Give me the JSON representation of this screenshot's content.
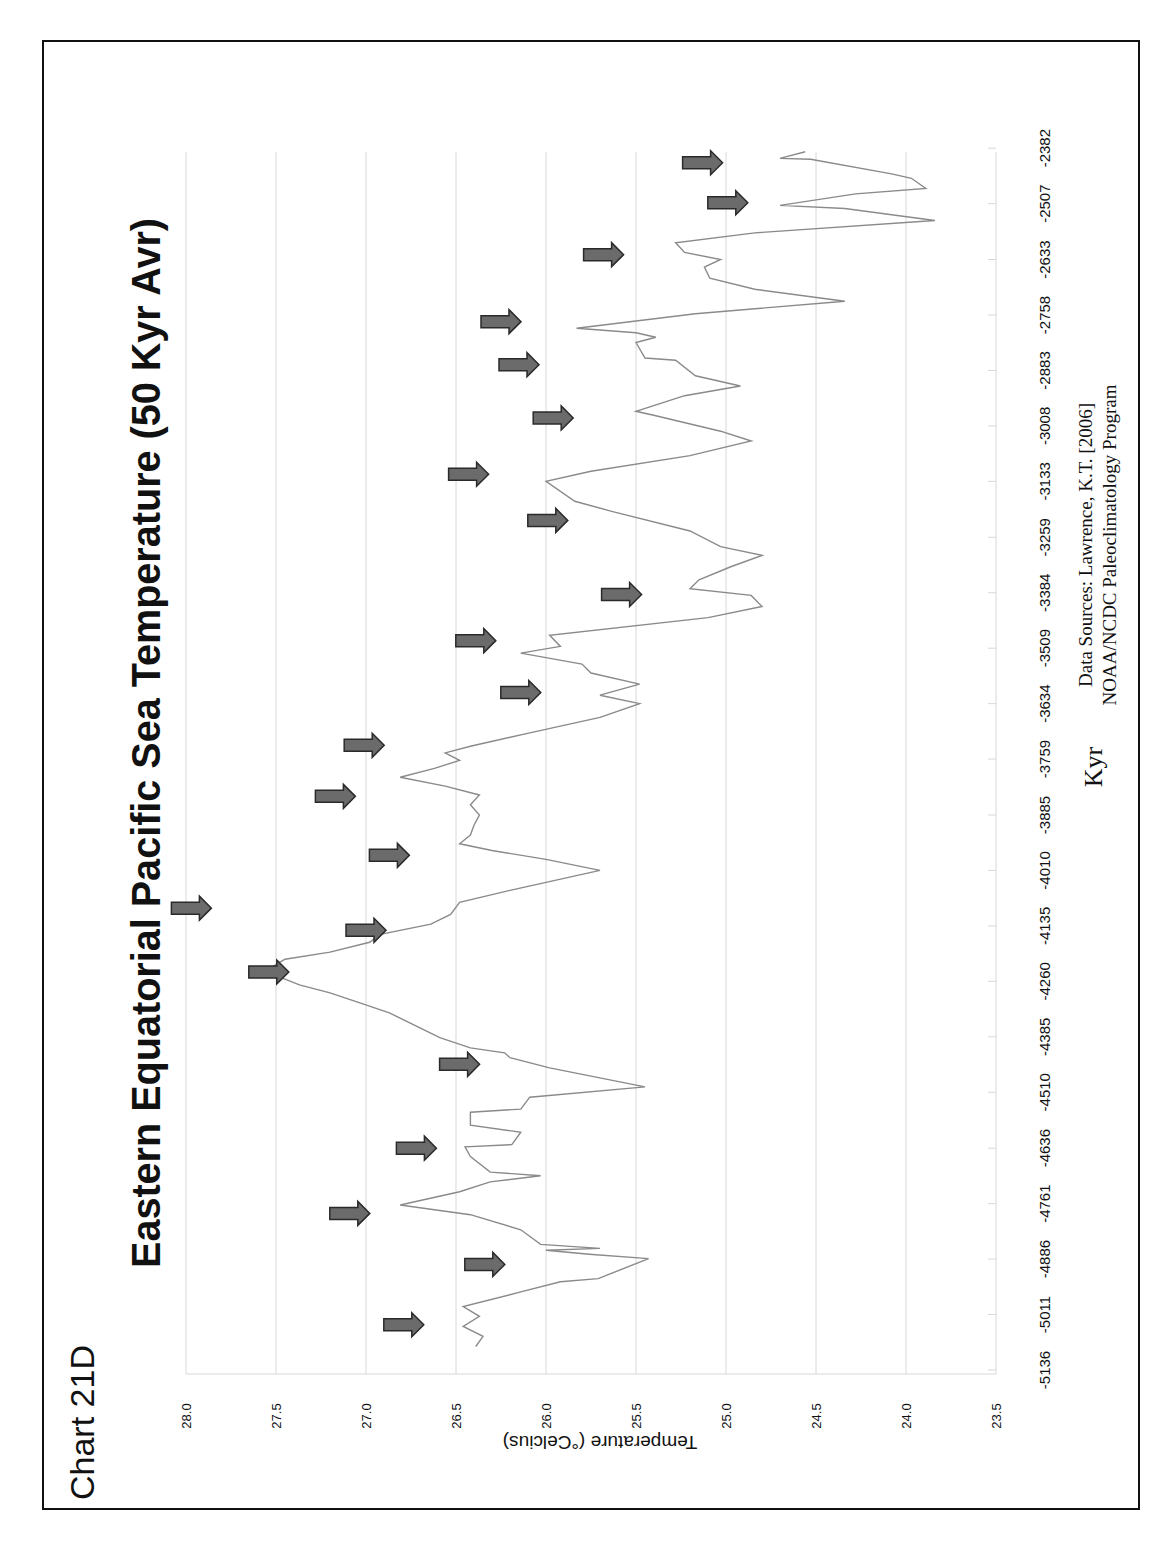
{
  "chart_label": "Chart 21D",
  "colors": {
    "line": "#8a8a8a",
    "grid": "#d8d8d8",
    "arrow_fill": "#6b6b6b",
    "arrow_stroke": "#2a2a2a",
    "frame": "#111111",
    "text": "#111111"
  },
  "chart_data": {
    "type": "line",
    "title": "Eastern Equatorial Pacific Sea Temperature (50 Kyr Avr)",
    "xlabel": "Kyr",
    "ylabel": "Temperature (°Celcius)",
    "orientation": "rotated-90-ccw",
    "xlim": [
      -5136,
      -2382
    ],
    "ylim": [
      23.5,
      28.0
    ],
    "grid": true,
    "x_ticks": [
      "-5136",
      "-5011",
      "-4886",
      "-4761",
      "-4636",
      "-4510",
      "-4385",
      "-4260",
      "-4135",
      "-4010",
      "-3885",
      "-3759",
      "-3634",
      "-3509",
      "-3384",
      "-3259",
      "-3133",
      "-3008",
      "-2883",
      "-2758",
      "-2633",
      "-2507",
      "-2382"
    ],
    "y_ticks": [
      "28.0",
      "27.5",
      "27.0",
      "26.5",
      "26.0",
      "25.5",
      "25.0",
      "24.5",
      "24.0",
      "23.5"
    ],
    "source_lines": [
      "Data Sources:  Lawrence, K.T. [2006]",
      "NOAA/NCDC Paleoclimatology Program"
    ],
    "series": [
      {
        "name": "Sea Temperature",
        "points": [
          [
            -5083,
            26.39
          ],
          [
            -5060,
            26.35
          ],
          [
            -5038,
            26.46
          ],
          [
            -5015,
            26.37
          ],
          [
            -4993,
            26.46
          ],
          [
            -4960,
            26.14
          ],
          [
            -4937,
            25.92
          ],
          [
            -4930,
            25.71
          ],
          [
            -4885,
            25.43
          ],
          [
            -4875,
            25.76
          ],
          [
            -4866,
            26.0
          ],
          [
            -4862,
            25.7
          ],
          [
            -4853,
            26.03
          ],
          [
            -4820,
            26.14
          ],
          [
            -4786,
            26.42
          ],
          [
            -4764,
            26.81
          ],
          [
            -4734,
            26.48
          ],
          [
            -4712,
            26.31
          ],
          [
            -4698,
            26.03
          ],
          [
            -4690,
            26.31
          ],
          [
            -4655,
            26.42
          ],
          [
            -4633,
            26.45
          ],
          [
            -4628,
            26.19
          ],
          [
            -4600,
            26.14
          ],
          [
            -4584,
            26.42
          ],
          [
            -4555,
            26.42
          ],
          [
            -4548,
            26.14
          ],
          [
            -4521,
            26.09
          ],
          [
            -4498,
            25.45
          ],
          [
            -4455,
            25.98
          ],
          [
            -4432,
            26.2
          ],
          [
            -4421,
            26.23
          ],
          [
            -4410,
            26.42
          ],
          [
            -4387,
            26.59
          ],
          [
            -4365,
            26.7
          ],
          [
            -4331,
            26.87
          ],
          [
            -4309,
            27.03
          ],
          [
            -4286,
            27.2
          ],
          [
            -4268,
            27.37
          ],
          [
            -4255,
            27.45
          ],
          [
            -4245,
            27.53
          ],
          [
            -4232,
            27.54
          ],
          [
            -4210,
            27.45
          ],
          [
            -4194,
            27.2
          ],
          [
            -4172,
            26.98
          ],
          [
            -4154,
            26.92
          ],
          [
            -4131,
            26.64
          ],
          [
            -4109,
            26.53
          ],
          [
            -4082,
            26.48
          ],
          [
            -4055,
            26.2
          ],
          [
            -4010,
            25.7
          ],
          [
            -3985,
            26.0
          ],
          [
            -3965,
            26.3
          ],
          [
            -3950,
            26.48
          ],
          [
            -3930,
            26.42
          ],
          [
            -3908,
            26.4
          ],
          [
            -3885,
            26.37
          ],
          [
            -3862,
            26.42
          ],
          [
            -3840,
            26.37
          ],
          [
            -3820,
            26.56
          ],
          [
            -3800,
            26.81
          ],
          [
            -3780,
            26.62
          ],
          [
            -3762,
            26.48
          ],
          [
            -3745,
            26.56
          ],
          [
            -3730,
            26.42
          ],
          [
            -3700,
            26.09
          ],
          [
            -3665,
            25.7
          ],
          [
            -3634,
            25.48
          ],
          [
            -3615,
            25.7
          ],
          [
            -3590,
            25.48
          ],
          [
            -3565,
            25.75
          ],
          [
            -3545,
            25.8
          ],
          [
            -3520,
            26.14
          ],
          [
            -3505,
            25.92
          ],
          [
            -3480,
            25.98
          ],
          [
            -3440,
            25.1
          ],
          [
            -3415,
            24.8
          ],
          [
            -3390,
            24.86
          ],
          [
            -3375,
            25.2
          ],
          [
            -3355,
            25.15
          ],
          [
            -3325,
            24.97
          ],
          [
            -3300,
            24.8
          ],
          [
            -3280,
            25.03
          ],
          [
            -3245,
            25.2
          ],
          [
            -3200,
            25.64
          ],
          [
            -3178,
            25.84
          ],
          [
            -3133,
            26.0
          ],
          [
            -3110,
            25.75
          ],
          [
            -3075,
            25.2
          ],
          [
            -3042,
            24.86
          ],
          [
            -3020,
            25.03
          ],
          [
            -2985,
            25.39
          ],
          [
            -2975,
            25.5
          ],
          [
            -2940,
            25.23
          ],
          [
            -2918,
            24.92
          ],
          [
            -2895,
            25.17
          ],
          [
            -2860,
            25.28
          ],
          [
            -2855,
            25.45
          ],
          [
            -2820,
            25.5
          ],
          [
            -2808,
            25.39
          ],
          [
            -2798,
            25.5
          ],
          [
            -2788,
            25.83
          ],
          [
            -2755,
            25.17
          ],
          [
            -2727,
            24.34
          ],
          [
            -2700,
            24.84
          ],
          [
            -2675,
            25.09
          ],
          [
            -2650,
            25.12
          ],
          [
            -2633,
            25.03
          ],
          [
            -2617,
            25.23
          ],
          [
            -2595,
            25.28
          ],
          [
            -2573,
            24.84
          ],
          [
            -2545,
            23.84
          ],
          [
            -2518,
            24.34
          ],
          [
            -2511,
            24.7
          ],
          [
            -2485,
            24.28
          ],
          [
            -2473,
            23.89
          ],
          [
            -2450,
            23.97
          ],
          [
            -2440,
            24.08
          ],
          [
            -2407,
            24.53
          ],
          [
            -2405,
            24.7
          ],
          [
            -2390,
            24.56
          ]
        ]
      }
    ],
    "annotations": {
      "type": "arrows",
      "description": "right-pointing arrows marking temperature peaks",
      "points": [
        [
          -5034,
          26.79
        ],
        [
          -4898,
          26.34
        ],
        [
          -4783,
          27.09
        ],
        [
          -4636,
          26.72
        ],
        [
          -4447,
          26.48
        ],
        [
          -4239,
          27.54
        ],
        [
          -4095,
          27.97
        ],
        [
          -4145,
          27.0
        ],
        [
          -3976,
          26.87
        ],
        [
          -3843,
          27.17
        ],
        [
          -3728,
          27.01
        ],
        [
          -3609,
          26.14
        ],
        [
          -3492,
          26.39
        ],
        [
          -3388,
          25.58
        ],
        [
          -3221,
          25.99
        ],
        [
          -3117,
          26.43
        ],
        [
          -2990,
          25.96
        ],
        [
          -2870,
          26.15
        ],
        [
          -2773,
          26.25
        ],
        [
          -2622,
          25.68
        ],
        [
          -2505,
          24.99
        ],
        [
          -2415,
          25.13
        ]
      ]
    }
  }
}
